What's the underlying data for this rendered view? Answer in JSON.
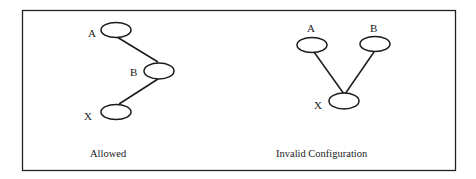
{
  "figure": {
    "left_panel": {
      "caption": "Allowed",
      "nodes": [
        {
          "label": "A"
        },
        {
          "label": "B"
        },
        {
          "label": "X"
        }
      ],
      "edges": [
        [
          "A",
          "B"
        ],
        [
          "B",
          "X"
        ]
      ]
    },
    "right_panel": {
      "caption": "Invalid Configuration",
      "nodes": [
        {
          "label": "A"
        },
        {
          "label": "B"
        },
        {
          "label": "X"
        }
      ],
      "edges": [
        [
          "A",
          "X"
        ],
        [
          "B",
          "X"
        ]
      ]
    }
  }
}
